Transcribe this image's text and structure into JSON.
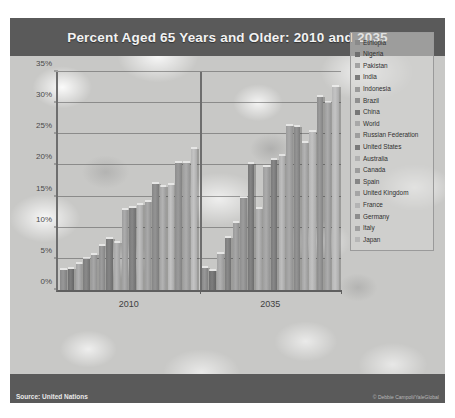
{
  "figure": {
    "title": "Percent Aged 65 Years and Older: 2010 and 2035",
    "source": "Source: United Nations",
    "credit": "© Debbie Campoli/YaleGlobal"
  },
  "chart_data": {
    "type": "bar",
    "title": "Percent Aged 65 Years and Older: 2010 and 2035",
    "xlabel": "",
    "ylabel": "",
    "ylim": [
      0,
      35
    ],
    "ytick_labels": [
      "0%",
      "5%",
      "10%",
      "15%",
      "20%",
      "25%",
      "30%",
      "35%"
    ],
    "ytick_values": [
      0,
      5,
      10,
      15,
      20,
      25,
      30,
      35
    ],
    "grid": true,
    "legend_position": "right",
    "categories": [
      "2010",
      "2035"
    ],
    "series": [
      {
        "name": "Ethiopia",
        "color": "#8a8a8a",
        "values": [
          3.2,
          3.6
        ]
      },
      {
        "name": "Nigeria",
        "color": "#6f6f6f",
        "values": [
          3.3,
          3.1
        ]
      },
      {
        "name": "Pakistan",
        "color": "#a3a3a3",
        "values": [
          4.2,
          5.8
        ]
      },
      {
        "name": "India",
        "color": "#7c7c7c",
        "values": [
          4.9,
          8.4
        ]
      },
      {
        "name": "Indonesia",
        "color": "#9a9a9a",
        "values": [
          5.6,
          10.8
        ]
      },
      {
        "name": "Brazil",
        "color": "#8f8f8f",
        "values": [
          7.0,
          14.8
        ]
      },
      {
        "name": "China",
        "color": "#777777",
        "values": [
          8.2,
          20.2
        ]
      },
      {
        "name": "World",
        "color": "#a8a8a8",
        "values": [
          7.6,
          13.0
        ]
      },
      {
        "name": "Russian Federation",
        "color": "#9e9e9e",
        "values": [
          12.8,
          19.8
        ]
      },
      {
        "name": "United States",
        "color": "#7a7a7a",
        "values": [
          13.1,
          20.9
        ]
      },
      {
        "name": "Australia",
        "color": "#b0b0b0",
        "values": [
          13.6,
          21.5
        ]
      },
      {
        "name": "Canada",
        "color": "#9c9c9c",
        "values": [
          14.1,
          26.4
        ]
      },
      {
        "name": "Spain",
        "color": "#868686",
        "values": [
          17.0,
          26.1
        ]
      },
      {
        "name": "United Kingdom",
        "color": "#a5a5a5",
        "values": [
          16.6,
          23.6
        ]
      },
      {
        "name": "France",
        "color": "#b4b4b4",
        "values": [
          16.8,
          25.4
        ]
      },
      {
        "name": "Germany",
        "color": "#8d8d8d",
        "values": [
          20.4,
          31.0
        ]
      },
      {
        "name": "Italy",
        "color": "#9f9f9f",
        "values": [
          20.4,
          30.0
        ]
      },
      {
        "name": "Japan",
        "color": "#b6b6b6",
        "values": [
          22.6,
          32.6
        ]
      }
    ]
  }
}
